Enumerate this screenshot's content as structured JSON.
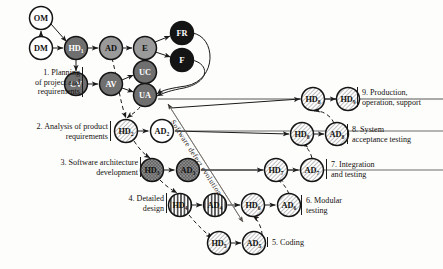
{
  "diagram": {
    "type": "process-flow-diagram",
    "annotation_label": "Software defect evolution",
    "colors": {
      "node_white": "#ffffff",
      "node_gray_dark": "#6f6f6f",
      "node_gray_mid": "#9a9a9a",
      "node_black": "#141414",
      "node_hatch": "#8d8d8d",
      "stroke": "#1a1a1a",
      "text_light": "#ffffff",
      "text_dark": "#111111",
      "background": "#fdfdfc"
    },
    "phases": [
      {
        "id": "p1",
        "number": "1.",
        "text": "1. Planning\nof project and\nrequirements",
        "align": "right",
        "x": 2,
        "y": 68,
        "w": 78
      },
      {
        "id": "p2",
        "number": "2.",
        "text": "2. Analysis of product\nrequirements",
        "align": "right",
        "x": 4,
        "y": 122,
        "w": 104
      },
      {
        "id": "p3",
        "number": "3.",
        "text": "3. Software architecture\ndevelopment",
        "align": "right",
        "x": 22,
        "y": 158,
        "w": 116
      },
      {
        "id": "p4",
        "number": "4.",
        "text": "4. Detailed\ndesign",
        "align": "right",
        "x": 104,
        "y": 194,
        "w": 60
      },
      {
        "id": "p5",
        "number": "5.",
        "text": "5. Coding",
        "align": "left",
        "x": 272,
        "y": 238,
        "w": 60
      },
      {
        "id": "p6",
        "number": "6.",
        "text": "6. Modular\ntesting",
        "align": "left",
        "x": 306,
        "y": 196,
        "w": 60
      },
      {
        "id": "p7",
        "number": "7.",
        "text": "7. Integration\nand testing",
        "align": "left",
        "x": 331,
        "y": 160,
        "w": 64
      },
      {
        "id": "p8",
        "number": "8.",
        "text": "8. System\nacceptance testing",
        "align": "left",
        "x": 352,
        "y": 125,
        "w": 86
      },
      {
        "id": "p9",
        "number": "9.",
        "text": "9. Production,\noperation, support",
        "align": "left",
        "x": 362,
        "y": 88,
        "w": 82
      }
    ],
    "nodes": [
      {
        "id": "OM",
        "label": "OM",
        "sub": "",
        "cx": 41,
        "cy": 18,
        "r": 11.5,
        "fill": "white",
        "text": "dark"
      },
      {
        "id": "DM",
        "label": "DM",
        "sub": "",
        "cx": 41,
        "cy": 48,
        "r": 11.5,
        "fill": "white",
        "text": "dark"
      },
      {
        "id": "HD1",
        "label": "HD",
        "sub": "1",
        "cx": 76,
        "cy": 48,
        "r": 11.5,
        "fill": "graydark",
        "text": "light"
      },
      {
        "id": "AD",
        "label": "AD",
        "sub": "",
        "cx": 111,
        "cy": 48,
        "r": 11.5,
        "fill": "graymid",
        "text": "dark"
      },
      {
        "id": "E",
        "label": "E",
        "sub": "",
        "cx": 145,
        "cy": 48,
        "r": 11.5,
        "fill": "graymid",
        "text": "dark"
      },
      {
        "id": "FR",
        "label": "FR",
        "sub": "",
        "cx": 182,
        "cy": 33,
        "r": 11.5,
        "fill": "black",
        "text": "light"
      },
      {
        "id": "F",
        "label": "F",
        "sub": "",
        "cx": 182,
        "cy": 60,
        "r": 11.5,
        "fill": "black",
        "text": "light"
      },
      {
        "id": "CV",
        "label": "CV",
        "sub": "",
        "cx": 76,
        "cy": 84,
        "r": 11.5,
        "fill": "graydark",
        "text": "light"
      },
      {
        "id": "AV",
        "label": "AV",
        "sub": "",
        "cx": 111,
        "cy": 84,
        "r": 11.5,
        "fill": "graydark",
        "text": "light"
      },
      {
        "id": "UC",
        "label": "UC",
        "sub": "",
        "cx": 145,
        "cy": 72,
        "r": 11.5,
        "fill": "graydark",
        "text": "light"
      },
      {
        "id": "UA",
        "label": "UA",
        "sub": "",
        "cx": 145,
        "cy": 95,
        "r": 11.5,
        "fill": "graydark",
        "text": "light"
      },
      {
        "id": "HD2",
        "label": "HD",
        "sub": "2",
        "cx": 126,
        "cy": 131,
        "r": 11.5,
        "fill": "hatch",
        "text": "dark"
      },
      {
        "id": "AD2",
        "label": "AD",
        "sub": "2",
        "cx": 162,
        "cy": 131,
        "r": 11.5,
        "fill": "white",
        "text": "dark"
      },
      {
        "id": "HD3",
        "label": "HD",
        "sub": "3",
        "cx": 152,
        "cy": 170,
        "r": 11.5,
        "fill": "crosshatch",
        "text": "dark"
      },
      {
        "id": "AD3",
        "label": "AD",
        "sub": "3",
        "cx": 188,
        "cy": 170,
        "r": 11.5,
        "fill": "crosshatch",
        "text": "dark"
      },
      {
        "id": "HD4",
        "label": "HD",
        "sub": "4",
        "cx": 180,
        "cy": 205,
        "r": 11.5,
        "fill": "vstripe",
        "text": "dark"
      },
      {
        "id": "AD4",
        "label": "AD",
        "sub": "4",
        "cx": 215,
        "cy": 205,
        "r": 11.5,
        "fill": "vstripe",
        "text": "dark"
      },
      {
        "id": "HD5",
        "label": "HD",
        "sub": "5",
        "cx": 219,
        "cy": 243,
        "r": 11.5,
        "fill": "hatch",
        "text": "dark"
      },
      {
        "id": "AD5",
        "label": "AD",
        "sub": "5",
        "cx": 254,
        "cy": 243,
        "r": 11.5,
        "fill": "hatch",
        "text": "dark"
      },
      {
        "id": "HD6",
        "label": "HD",
        "sub": "6",
        "cx": 253,
        "cy": 205,
        "r": 11.5,
        "fill": "hatch",
        "text": "dark"
      },
      {
        "id": "AD6",
        "label": "AD",
        "sub": "6",
        "cx": 289,
        "cy": 205,
        "r": 11.5,
        "fill": "hatch",
        "text": "dark"
      },
      {
        "id": "HD7",
        "label": "HD",
        "sub": "7",
        "cx": 276,
        "cy": 170,
        "r": 11.5,
        "fill": "hatch",
        "text": "dark"
      },
      {
        "id": "AD7",
        "label": "AD",
        "sub": "7",
        "cx": 312,
        "cy": 170,
        "r": 11.5,
        "fill": "hatch",
        "text": "dark"
      },
      {
        "id": "HD8",
        "label": "HD",
        "sub": "8",
        "cx": 302,
        "cy": 134,
        "r": 11.5,
        "fill": "hatch",
        "text": "dark"
      },
      {
        "id": "AD8",
        "label": "AD",
        "sub": "8",
        "cx": 337,
        "cy": 134,
        "r": 11.5,
        "fill": "hatch",
        "text": "dark"
      },
      {
        "id": "HD8b",
        "label": "HD",
        "sub": "8",
        "cx": 313,
        "cy": 99,
        "r": 11.5,
        "fill": "hatch",
        "text": "dark"
      },
      {
        "id": "HD9",
        "label": "HD",
        "sub": "9",
        "cx": 348,
        "cy": 99,
        "r": 11.5,
        "fill": "hatch",
        "text": "dark"
      }
    ]
  }
}
